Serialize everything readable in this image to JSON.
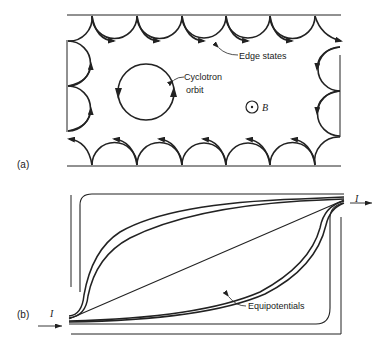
{
  "figure": {
    "panel_a": {
      "label": "(a)",
      "annotations": {
        "edge_states": "Edge states",
        "cyclotron_line1": "Cyclotron",
        "cyclotron_line2": "orbit",
        "field_symbol": "B"
      }
    },
    "panel_b": {
      "label": "(b)",
      "annotations": {
        "equipotentials": "Equipotentials",
        "current_in": "I",
        "current_out": "I"
      }
    },
    "colors": {
      "ink": "#222222",
      "background": "#ffffff"
    }
  }
}
